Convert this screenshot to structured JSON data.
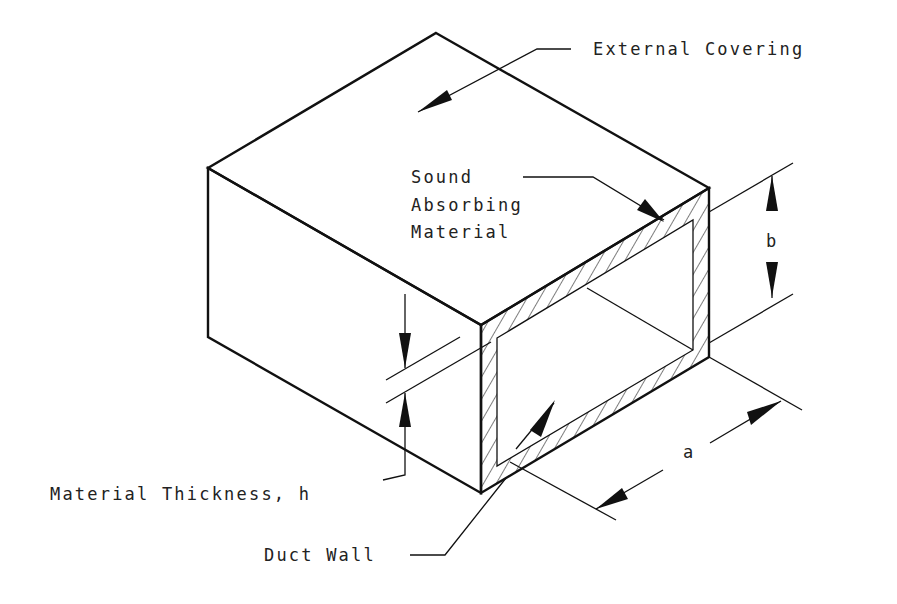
{
  "figure": {
    "labels": {
      "external_covering": "External Covering",
      "sound_absorbing_line1": "Sound",
      "sound_absorbing_line2": "Absorbing",
      "sound_absorbing_line3": "Material",
      "dimension_b": "b",
      "dimension_a": "a",
      "material_thickness": "Material Thickness, h",
      "duct_wall": "Duct Wall"
    },
    "colors": {
      "line": "#111111",
      "background": "#ffffff"
    }
  }
}
